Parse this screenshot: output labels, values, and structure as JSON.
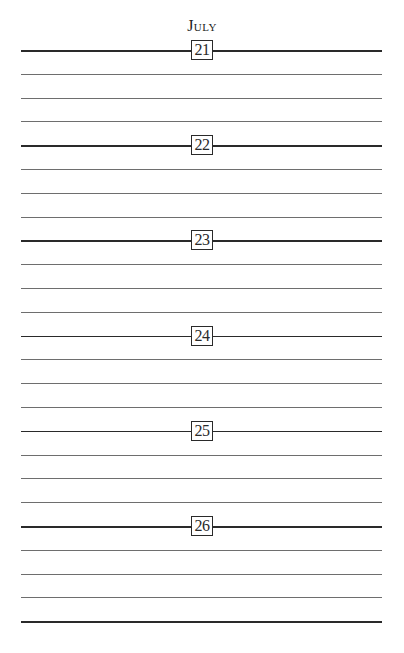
{
  "page": {
    "month": "July",
    "days": [
      {
        "number": "21",
        "lines": 4
      },
      {
        "number": "22",
        "lines": 4
      },
      {
        "number": "23",
        "lines": 4
      },
      {
        "number": "24",
        "lines": 4
      },
      {
        "number": "25",
        "lines": 4
      },
      {
        "number": "26",
        "lines": 4
      }
    ]
  },
  "colors": {
    "day_rule": "#2a2a2a",
    "ruled_line": "#6e6e6e",
    "paper": "#ffffff"
  }
}
